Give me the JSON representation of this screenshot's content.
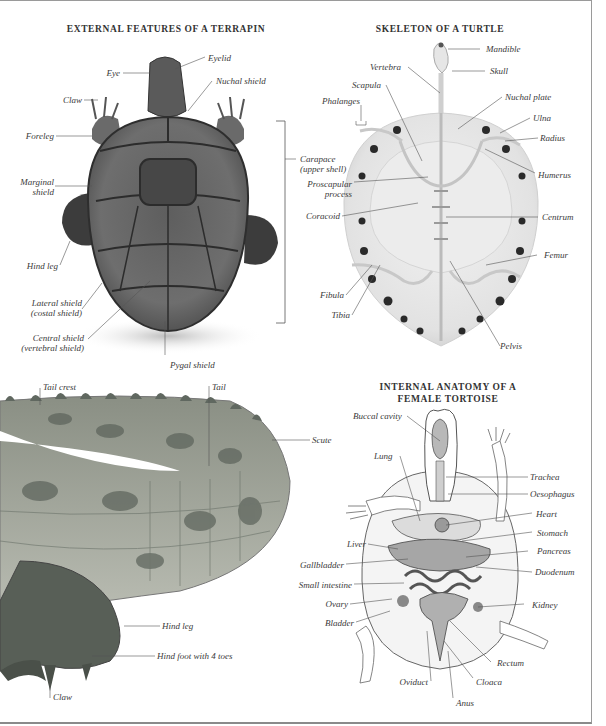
{
  "sections": {
    "terrapin": {
      "title": "EXTERNAL FEATURES OF A TERRAPIN",
      "labels": {
        "eyelid": "Eyelid",
        "eye": "Eye",
        "nuchal_shield": "Nuchal shield",
        "claw": "Claw",
        "foreleg": "Foreleg",
        "marginal_shield_1": "Marginal",
        "marginal_shield_2": "shield",
        "hind_leg": "Hind leg",
        "lateral_shield_1": "Lateral shield",
        "lateral_shield_2": "(costal shield)",
        "central_shield_1": "Central shield",
        "central_shield_2": "(vertebral shield)",
        "pygal_shield": "Pygal shield",
        "carapace_1": "Carapace",
        "carapace_2": "(upper shell)"
      }
    },
    "skeleton": {
      "title": "SKELETON OF A TURTLE",
      "labels": {
        "mandible": "Mandible",
        "skull": "Skull",
        "vertebra": "Vertebra",
        "scapula": "Scapula",
        "phalanges": "Phalanges",
        "nuchal_plate": "Nuchal plate",
        "ulna": "Ulna",
        "radius": "Radius",
        "humerus": "Humerus",
        "proscapular_1": "Proscapular",
        "proscapular_2": "process",
        "coracoid": "Coracoid",
        "centrum": "Centrum",
        "femur": "Femur",
        "fibula": "Fibula",
        "tibia": "Tibia",
        "pelvis": "Pelvis"
      }
    },
    "crocodile": {
      "labels": {
        "tail_crest": "Tail crest",
        "tail": "Tail",
        "scute": "Scute",
        "hind_leg": "Hind leg",
        "hind_foot": "Hind foot with 4 toes",
        "claw": "Claw"
      }
    },
    "tortoise": {
      "title_1": "INTERNAL ANATOMY OF A",
      "title_2": "FEMALE TORTOISE",
      "labels": {
        "buccal_cavity": "Buccal cavity",
        "lung": "Lung",
        "trachea": "Trachea",
        "oesophagus": "Oesophagus",
        "heart": "Heart",
        "stomach": "Stomach",
        "liver": "Liver",
        "pancreas": "Pancreas",
        "gallbladder": "Gallbladder",
        "duodenum": "Duodenum",
        "small_intestine": "Small intestine",
        "ovary": "Ovary",
        "kidney": "Kidney",
        "bladder": "Bladder",
        "rectum": "Rectum",
        "oviduct": "Oviduct",
        "cloaca": "Cloaca",
        "anus": "Anus"
      }
    }
  },
  "colors": {
    "page_border": "#9a9a9a",
    "label_text": "#3a3a3a",
    "leader_line": "#555555"
  }
}
